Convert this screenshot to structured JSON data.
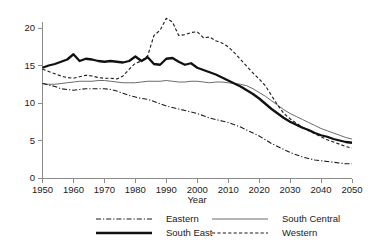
{
  "chart_data": {
    "type": "line",
    "title": "",
    "xlabel": "Year",
    "ylabel": "",
    "xlim": [
      1950,
      2050
    ],
    "ylim": [
      0,
      22
    ],
    "grid": false,
    "legend_position": "bottom",
    "xticks": [
      1950,
      1960,
      1970,
      1980,
      1990,
      2000,
      2010,
      2020,
      2030,
      2040,
      2050
    ],
    "yticks": [
      0,
      5,
      10,
      15,
      20
    ],
    "x": [
      1950,
      1952,
      1954,
      1956,
      1958,
      1960,
      1962,
      1964,
      1966,
      1968,
      1970,
      1972,
      1974,
      1976,
      1978,
      1980,
      1982,
      1984,
      1986,
      1988,
      1990,
      1992,
      1994,
      1996,
      1998,
      2000,
      2002,
      2004,
      2006,
      2008,
      2010,
      2012,
      2014,
      2016,
      2018,
      2020,
      2022,
      2024,
      2026,
      2028,
      2030,
      2032,
      2034,
      2036,
      2038,
      2040,
      2042,
      2044,
      2046,
      2048,
      2050
    ],
    "series": [
      {
        "name": "Eastern",
        "style": "dashdot",
        "width": 1.1,
        "color": "#1a1a1a",
        "values": [
          12.6,
          12.4,
          12.2,
          11.9,
          11.8,
          11.7,
          11.8,
          11.9,
          11.9,
          11.9,
          11.9,
          11.8,
          11.6,
          11.3,
          11.0,
          10.8,
          10.6,
          10.5,
          10.2,
          9.9,
          9.6,
          9.4,
          9.2,
          9.0,
          8.8,
          8.6,
          8.3,
          8.0,
          7.8,
          7.6,
          7.4,
          7.1,
          6.8,
          6.4,
          6.0,
          5.6,
          5.1,
          4.6,
          4.2,
          3.8,
          3.4,
          3.1,
          2.8,
          2.6,
          2.4,
          2.3,
          2.2,
          2.1,
          2.0,
          1.9,
          1.9
        ]
      },
      {
        "name": "South East",
        "style": "solid",
        "width": 2.3,
        "color": "#111111",
        "values": [
          14.7,
          15.0,
          15.2,
          15.5,
          15.8,
          16.5,
          15.6,
          15.9,
          15.8,
          15.6,
          15.5,
          15.6,
          15.5,
          15.4,
          15.6,
          16.2,
          15.6,
          16.1,
          15.2,
          15.1,
          15.9,
          16.0,
          15.5,
          15.1,
          15.3,
          14.7,
          14.4,
          14.1,
          13.8,
          13.4,
          13.0,
          12.6,
          12.2,
          11.7,
          11.2,
          10.6,
          9.9,
          9.2,
          8.6,
          8.0,
          7.5,
          7.1,
          6.7,
          6.4,
          6.0,
          5.7,
          5.5,
          5.2,
          5.0,
          4.8,
          4.7
        ]
      },
      {
        "name": "South Central",
        "style": "solid",
        "width": 1.0,
        "color": "#6b6b6b",
        "values": [
          12.6,
          12.5,
          12.5,
          12.6,
          12.7,
          12.8,
          12.9,
          12.9,
          12.9,
          13.0,
          13.0,
          12.9,
          12.8,
          12.7,
          12.7,
          12.7,
          12.8,
          12.9,
          12.9,
          12.9,
          13.0,
          12.9,
          12.8,
          12.8,
          12.9,
          12.9,
          12.8,
          12.7,
          12.8,
          12.8,
          12.7,
          12.6,
          12.5,
          12.3,
          11.9,
          11.4,
          10.9,
          10.3,
          9.7,
          9.1,
          8.6,
          8.2,
          7.8,
          7.4,
          7.0,
          6.6,
          6.3,
          6.0,
          5.7,
          5.4,
          5.2
        ]
      },
      {
        "name": "Western",
        "style": "dashed",
        "width": 1.1,
        "color": "#1a1a1a",
        "values": [
          14.5,
          14.2,
          13.9,
          13.6,
          13.4,
          13.3,
          13.5,
          13.7,
          13.6,
          13.4,
          13.3,
          13.3,
          13.2,
          13.6,
          14.5,
          15.3,
          15.6,
          16.3,
          19.0,
          19.7,
          21.3,
          20.8,
          19.0,
          19.1,
          19.4,
          19.5,
          18.7,
          18.8,
          18.3,
          18.0,
          17.5,
          16.7,
          15.8,
          14.9,
          14.0,
          13.2,
          12.3,
          11.0,
          9.7,
          8.6,
          7.9,
          7.3,
          6.8,
          6.3,
          5.9,
          5.5,
          5.1,
          4.8,
          4.5,
          4.2,
          4.0
        ]
      }
    ],
    "legend": [
      {
        "label": "Eastern",
        "style": "dashdot",
        "width": 1.1,
        "color": "#1a1a1a"
      },
      {
        "label": "South Central",
        "style": "solid",
        "width": 1.0,
        "color": "#6b6b6b"
      },
      {
        "label": "South East",
        "style": "solid",
        "width": 2.3,
        "color": "#111111"
      },
      {
        "label": "Western",
        "style": "dashed",
        "width": 1.1,
        "color": "#1a1a1a"
      }
    ]
  }
}
